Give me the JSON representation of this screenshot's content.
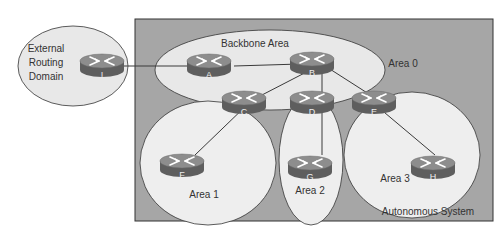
{
  "diagram": {
    "as_label": "Autonomous System",
    "external_label_lines": [
      "External",
      "Routing",
      "Domain"
    ],
    "areas": {
      "backbone_title": "Backbone Area",
      "area0": "Area 0",
      "area1": "Area 1",
      "area2": "Area 2",
      "area3": "Area 3"
    },
    "routers": {
      "I": "I",
      "A": "A",
      "B": "B",
      "C": "C",
      "D": "D",
      "E": "E",
      "F": "F",
      "G": "G",
      "H": "H"
    },
    "colors": {
      "as_background": "#a6a6a6",
      "area_fill": "#e8e8e8",
      "router_top": "#8c8c8c",
      "router_side": "#5e5e5e",
      "line": "#3a3a3a"
    }
  }
}
